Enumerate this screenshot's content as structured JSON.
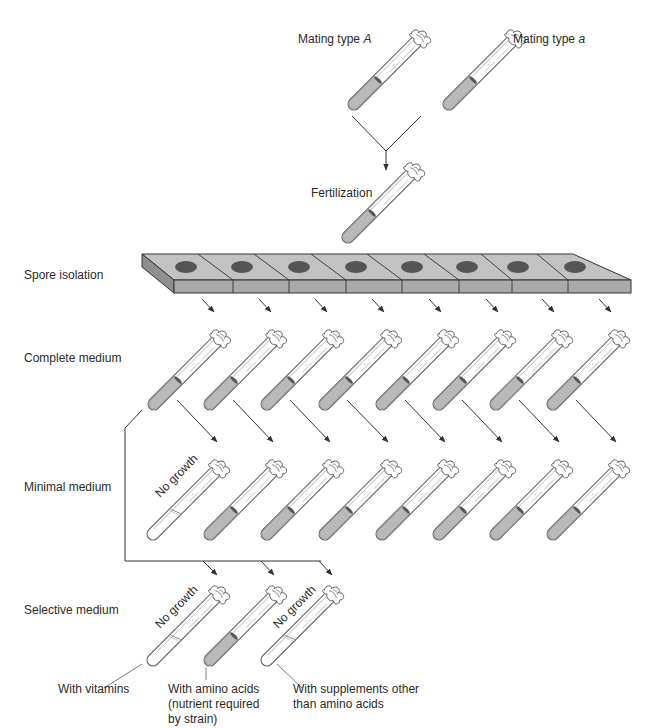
{
  "diagram": {
    "colors": {
      "line": "#333333",
      "tube_outline": "#6a6a6a",
      "medium_fill": "#b9b9b9",
      "strip_top": "#c2c2c2",
      "strip_front": "#a9a9a9",
      "strip_side": "#8f8f8f",
      "well": "#555555"
    },
    "top": {
      "parent_a_label_prefix": "Mating type ",
      "parent_a_label_italic": "A",
      "parent_b_label_prefix": "Mating type ",
      "parent_b_label_italic": "a",
      "fertilization_label": "Fertilization"
    },
    "rows": {
      "spore_isolation": "Spore isolation",
      "complete_medium": "Complete medium",
      "minimal_medium": "Minimal medium",
      "selective_medium": "Selective medium"
    },
    "spore_strip": {
      "wells": 8
    },
    "complete_row": {
      "tube_count": 8,
      "all_growth": true
    },
    "minimal_row": {
      "tube_count": 8,
      "no_growth_index": 0,
      "no_growth_label": "No growth"
    },
    "selective_row": {
      "tubes": [
        {
          "growth": false,
          "status_label": "No growth",
          "supplement_label": "With vitamins"
        },
        {
          "growth": true,
          "status_label": "",
          "supplement_label": "With amino acids (nutrient required by strain)"
        },
        {
          "growth": false,
          "status_label": "No growth",
          "supplement_label": "With supplements other than amino acids"
        }
      ],
      "label_lines": {
        "t0": [
          "With vitamins"
        ],
        "t1": [
          "With amino acids",
          "(nutrient required",
          "by strain)"
        ],
        "t2": [
          "With supplements other",
          "than amino acids"
        ]
      }
    }
  }
}
